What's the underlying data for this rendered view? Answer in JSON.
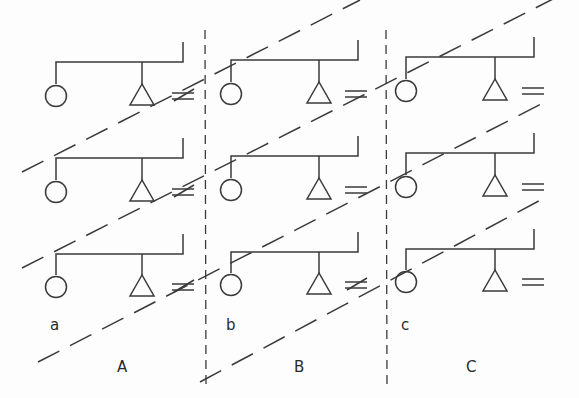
{
  "diagram": {
    "panels": [
      {
        "id": "A",
        "label": "A",
        "sublabel": "a",
        "rows": [
          {
            "left_symbol": "circle",
            "right_symbol": "triangle",
            "relation": "not-equal"
          },
          {
            "left_symbol": "circle",
            "right_symbol": "triangle",
            "relation": "not-equal"
          },
          {
            "left_symbol": "circle",
            "right_symbol": "triangle",
            "relation": "not-equal"
          }
        ]
      },
      {
        "id": "B",
        "label": "B",
        "sublabel": "b",
        "rows": [
          {
            "left_symbol": "circle",
            "right_symbol": "triangle",
            "relation": "equal"
          },
          {
            "left_symbol": "circle",
            "right_symbol": "triangle",
            "relation": "equal"
          },
          {
            "left_symbol": "circle",
            "right_symbol": "triangle",
            "relation": "not-equal"
          }
        ]
      },
      {
        "id": "C",
        "label": "C",
        "sublabel": "c",
        "rows": [
          {
            "left_symbol": "circle",
            "right_symbol": "triangle",
            "relation": "equal"
          },
          {
            "left_symbol": "circle",
            "right_symbol": "triangle",
            "relation": "equal"
          },
          {
            "left_symbol": "circle",
            "right_symbol": "triangle",
            "relation": "equal"
          }
        ]
      }
    ],
    "separators": [
      "vertical-dashed",
      "vertical-dashed"
    ],
    "diagonal_dashed_lines": 4,
    "colors": {
      "ink": "#3a3a3a",
      "background": "#fdfdfd"
    }
  }
}
